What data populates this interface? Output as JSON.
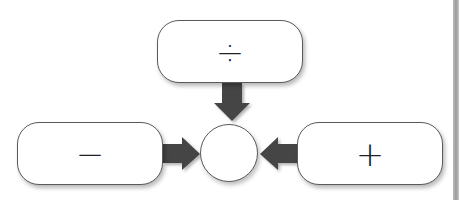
{
  "diagram": {
    "nodes": {
      "top": {
        "symbol": "÷",
        "meaning": "divide"
      },
      "left": {
        "symbol": "−",
        "meaning": "subtract"
      },
      "right": {
        "symbol": "+",
        "meaning": "add"
      },
      "center": {
        "symbol": ""
      }
    },
    "edges": [
      {
        "from": "top",
        "to": "center"
      },
      {
        "from": "left",
        "to": "center"
      },
      {
        "from": "right",
        "to": "center"
      }
    ],
    "colors": {
      "arrow": "#444444",
      "border": "#5a5a5a",
      "background": "#ffffff"
    }
  }
}
